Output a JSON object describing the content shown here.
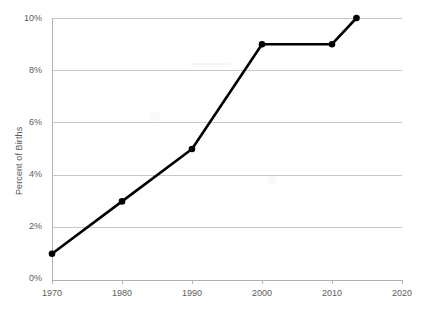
{
  "chart_data": {
    "type": "line",
    "title": "",
    "xlabel": "",
    "ylabel": "Percent of Births",
    "xlim": [
      1970,
      2020
    ],
    "ylim": [
      0,
      10
    ],
    "grid": true,
    "legend": "none",
    "x_tick_labels": [
      "1970",
      "1980",
      "1990",
      "2000",
      "2010",
      "2020"
    ],
    "x_ticks": [
      1970,
      1980,
      1990,
      2000,
      2010,
      2020
    ],
    "y_tick_labels": [
      "0%",
      "2%",
      "4%",
      "6%",
      "8%",
      "10%"
    ],
    "y_ticks": [
      0,
      2,
      4,
      6,
      8,
      10
    ],
    "series": [
      {
        "name": "Percent of Births",
        "color": "#000000",
        "marker": "circle",
        "x": [
          1970,
          1980,
          1990,
          2000,
          2010,
          2013.5
        ],
        "values": [
          1,
          3,
          5,
          9,
          9,
          10
        ],
        "points": [
          {
            "x": 1970,
            "y": 1,
            "label": "1%"
          },
          {
            "x": 1980,
            "y": 3,
            "label": "3%"
          },
          {
            "x": 1990,
            "y": 5,
            "label": "5%"
          },
          {
            "x": 2000,
            "y": 9,
            "label": "9%"
          },
          {
            "x": 2010,
            "y": 9,
            "label": "9%"
          },
          {
            "x": 2013.5,
            "y": 10,
            "label": "10%"
          }
        ]
      }
    ],
    "colors": {
      "line": "#000000",
      "grid": "#c8c8c8",
      "axis": "#b5b5b5",
      "tick_text": "#5c5c5c",
      "background": "#ffffff"
    }
  }
}
